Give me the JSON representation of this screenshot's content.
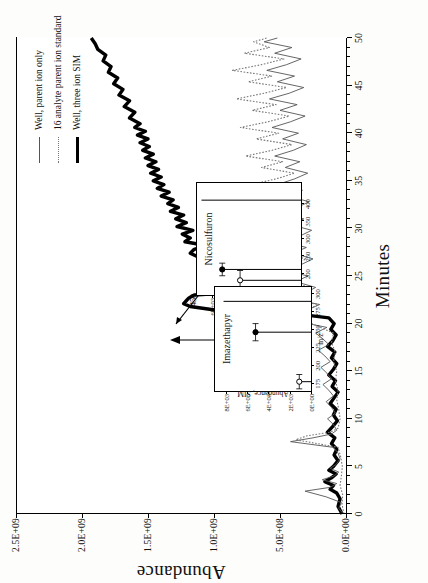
{
  "figure": {
    "kind": "gc-ms-chromatogram",
    "rotation_note": "printed rotated 90 degrees counter-clockwise"
  },
  "legend": {
    "position": "upper-left-of-rotated-page",
    "items": [
      {
        "label": "Well, parent ion only",
        "style": "thin",
        "color": "#555555"
      },
      {
        "label": "16 analyte parent ion standard",
        "style": "dot",
        "color": "#777777"
      },
      {
        "label": "Well, three ion SIM",
        "style": "bold",
        "color": "#000000"
      }
    ]
  },
  "chart_data": {
    "type": "line",
    "title": "",
    "xlabel": "Minutes",
    "ylabel": "Abundance",
    "xlim": [
      0,
      50
    ],
    "ylim": [
      0,
      2500000000
    ],
    "xticks": [
      0,
      5,
      10,
      15,
      20,
      25,
      30,
      35,
      40,
      45,
      50
    ],
    "xticklabels": [
      "0",
      "5",
      "10",
      "15",
      "20",
      "25",
      "30",
      "35",
      "40",
      "45",
      "50"
    ],
    "yticks": [
      0,
      500000000,
      1000000000,
      1500000000,
      2000000000,
      2500000000
    ],
    "yticklabels": [
      "0.0E+00",
      "5.0E+08",
      "1.0E+09",
      "1.5E+09",
      "2.0E+09",
      "2.5E+09"
    ],
    "grid": false,
    "legend_position": "upper right",
    "series": [
      {
        "name": "Well, three ion SIM",
        "style": "bold",
        "color": "#000000",
        "x": [
          0.0,
          0.8,
          1.6,
          2.2,
          2.6,
          3.0,
          3.4,
          3.8,
          4.2,
          4.6,
          5.0,
          5.6,
          6.2,
          6.8,
          7.4,
          8.0,
          8.6,
          9.2,
          9.8,
          10.4,
          11.0,
          11.6,
          12.2,
          12.8,
          13.4,
          14.0,
          14.6,
          15.2,
          15.8,
          16.4,
          17.0,
          17.6,
          18.2,
          18.8,
          19.4,
          20.0,
          20.6,
          21.0,
          21.4,
          21.8,
          22.1,
          22.4,
          22.7,
          23.0,
          23.4,
          23.8,
          24.2,
          24.6,
          25.0,
          25.4,
          25.8,
          26.2,
          26.6,
          27.0,
          27.4,
          27.8,
          28.2,
          28.6,
          29.0,
          29.4,
          29.8,
          30.2,
          30.6,
          31.0,
          31.4,
          31.8,
          32.2,
          32.6,
          33.0,
          33.4,
          33.8,
          34.2,
          34.6,
          35.0,
          35.4,
          35.8,
          36.2,
          36.6,
          37.0,
          37.4,
          37.8,
          38.2,
          38.6,
          39.0,
          39.4,
          39.8,
          40.2,
          40.6,
          41.0,
          41.6,
          42.2,
          42.8,
          43.4,
          44.0,
          44.6,
          45.2,
          45.8,
          46.4,
          47.0,
          47.6,
          48.2,
          48.8,
          49.4,
          50.0
        ],
        "y": [
          30000000,
          60000000,
          45000000,
          70000000,
          120000000,
          95000000,
          160000000,
          110000000,
          75000000,
          130000000,
          95000000,
          60000000,
          90000000,
          70000000,
          110000000,
          85000000,
          140000000,
          100000000,
          65000000,
          95000000,
          75000000,
          120000000,
          90000000,
          60000000,
          105000000,
          80000000,
          130000000,
          95000000,
          70000000,
          110000000,
          85000000,
          140000000,
          100000000,
          75000000,
          115000000,
          90000000,
          130000000,
          360000000,
          980000000,
          1180000000,
          1230000000,
          1210000000,
          1190000000,
          1150000000,
          700000000,
          480000000,
          430000000,
          470000000,
          540000000,
          520000000,
          560000000,
          620000000,
          900000000,
          1120000000,
          1180000000,
          1150000000,
          1060000000,
          1220000000,
          1180000000,
          1240000000,
          1160000000,
          1280000000,
          1210000000,
          1290000000,
          1230000000,
          1330000000,
          1270000000,
          1350000000,
          1310000000,
          1400000000,
          1340000000,
          1430000000,
          1380000000,
          1460000000,
          1400000000,
          1480000000,
          1420000000,
          1500000000,
          1440000000,
          1520000000,
          1460000000,
          1540000000,
          1490000000,
          1560000000,
          1500000000,
          1580000000,
          1520000000,
          1600000000,
          1560000000,
          1640000000,
          1600000000,
          1680000000,
          1640000000,
          1720000000,
          1690000000,
          1760000000,
          1730000000,
          1800000000,
          1780000000,
          1840000000,
          1820000000,
          1880000000,
          1900000000,
          1930000000
        ]
      },
      {
        "name": "Well, parent ion only",
        "style": "thin",
        "color": "#555555",
        "x": [
          0.0,
          0.6,
          1.2,
          1.8,
          2.4,
          2.8,
          3.2,
          3.6,
          4.0,
          4.4,
          4.8,
          5.2,
          5.8,
          6.4,
          7.0,
          7.6,
          8.0,
          8.4,
          8.8,
          9.4,
          10.0,
          10.6,
          11.2,
          11.8,
          12.4,
          13.0,
          13.6,
          14.2,
          14.8,
          15.4,
          16.0,
          16.6,
          17.2,
          17.8,
          18.4,
          19.0,
          19.6,
          20.2,
          20.8,
          21.4,
          22.0,
          22.6,
          23.2,
          23.8,
          24.4,
          25.0,
          25.6,
          26.2,
          26.8,
          27.4,
          28.0,
          28.6,
          29.2,
          29.8,
          30.4,
          31.0,
          31.6,
          32.2,
          32.8,
          33.4,
          34.0,
          34.6,
          35.2,
          35.8,
          36.4,
          37.0,
          37.6,
          38.2,
          38.8,
          39.4,
          40.0,
          40.6,
          41.2,
          41.8,
          42.4,
          43.0,
          43.6,
          44.2,
          44.8,
          45.4,
          46.0,
          46.6,
          47.2,
          47.8,
          48.4,
          49.0,
          49.6,
          50.0
        ],
        "y": [
          20000000,
          55000000,
          35000000,
          150000000,
          310000000,
          120000000,
          70000000,
          180000000,
          90000000,
          55000000,
          120000000,
          75000000,
          45000000,
          60000000,
          95000000,
          420000000,
          250000000,
          110000000,
          70000000,
          95000000,
          140000000,
          80000000,
          110000000,
          150000000,
          95000000,
          130000000,
          175000000,
          110000000,
          145000000,
          190000000,
          120000000,
          160000000,
          210000000,
          130000000,
          175000000,
          230000000,
          145000000,
          360000000,
          480000000,
          300000000,
          200000000,
          420000000,
          310000000,
          230000000,
          380000000,
          290000000,
          460000000,
          340000000,
          250000000,
          400000000,
          300000000,
          480000000,
          350000000,
          260000000,
          420000000,
          320000000,
          500000000,
          370000000,
          280000000,
          440000000,
          330000000,
          520000000,
          390000000,
          290000000,
          460000000,
          350000000,
          540000000,
          400000000,
          300000000,
          480000000,
          360000000,
          560000000,
          420000000,
          310000000,
          500000000,
          370000000,
          580000000,
          430000000,
          320000000,
          520000000,
          390000000,
          600000000,
          450000000,
          340000000,
          540000000,
          410000000,
          620000000,
          520000000
        ]
      },
      {
        "name": "16 analyte parent ion standard",
        "style": "dot",
        "color": "#777777",
        "x": [
          0.0,
          1.0,
          2.0,
          3.0,
          4.0,
          5.0,
          6.0,
          7.0,
          7.8,
          8.2,
          8.6,
          9.0,
          10.0,
          11.0,
          12.0,
          13.0,
          14.0,
          15.0,
          16.0,
          17.0,
          18.0,
          19.0,
          20.0,
          20.6,
          21.0,
          21.5,
          22.0,
          22.6,
          23.2,
          23.8,
          24.4,
          25.0,
          25.6,
          26.2,
          26.8,
          27.4,
          28.0,
          28.6,
          29.2,
          29.8,
          30.4,
          31.0,
          31.6,
          32.2,
          32.8,
          33.4,
          34.0,
          34.6,
          35.2,
          35.8,
          36.4,
          37.0,
          37.6,
          38.2,
          38.8,
          39.4,
          40.0,
          40.6,
          41.2,
          41.8,
          42.4,
          43.0,
          43.6,
          44.2,
          44.8,
          45.4,
          46.0,
          46.6,
          47.2,
          47.8,
          48.4,
          49.0,
          49.6,
          50.0
        ],
        "y": [
          15000000,
          30000000,
          25000000,
          45000000,
          35000000,
          28000000,
          40000000,
          60000000,
          380000000,
          300000000,
          120000000,
          60000000,
          45000000,
          55000000,
          70000000,
          60000000,
          80000000,
          70000000,
          95000000,
          80000000,
          110000000,
          95000000,
          260000000,
          520000000,
          420000000,
          300000000,
          200000000,
          480000000,
          360000000,
          270000000,
          440000000,
          340000000,
          540000000,
          410000000,
          300000000,
          500000000,
          380000000,
          620000000,
          460000000,
          340000000,
          560000000,
          420000000,
          680000000,
          500000000,
          370000000,
          600000000,
          450000000,
          720000000,
          530000000,
          390000000,
          640000000,
          480000000,
          760000000,
          560000000,
          410000000,
          680000000,
          510000000,
          800000000,
          590000000,
          430000000,
          710000000,
          530000000,
          830000000,
          620000000,
          450000000,
          740000000,
          560000000,
          860000000,
          640000000,
          470000000,
          770000000,
          580000000,
          700000000,
          600000000
        ]
      }
    ]
  },
  "insets": [
    {
      "id": "nicosulfuron",
      "title": "Nicosulfuron",
      "xlabel": "",
      "ylabel": "Abundance, SIM",
      "xticks": [
        150,
        200,
        250,
        300,
        350,
        400
      ],
      "xticklabels": [
        "150",
        "200",
        "250",
        "300",
        "350",
        "400"
      ],
      "yticks": [
        0,
        2000,
        4000,
        6000
      ],
      "yticklabels": [
        "0E+00",
        "2E+03",
        "4E+03",
        "6E+03"
      ],
      "xlim": [
        140,
        460
      ],
      "ylim": [
        0,
        7000
      ],
      "points": [
        {
          "mz": 182,
          "value": 4100,
          "marker": "open",
          "err": 28
        },
        {
          "mz": 213,
          "value": 5300,
          "marker": "filled",
          "err": 18
        }
      ],
      "baseline_peaks": [
        {
          "mz": 182,
          "value": 4100
        },
        {
          "mz": 213,
          "value": 5300
        },
        {
          "mz": 411,
          "value": 6700
        }
      ],
      "annotation_tick": "450"
    },
    {
      "id": "imazethapyr",
      "title": "Imazethapyr",
      "xlabel": "m/z",
      "ylabel": "Abundance, SIM",
      "xticks": [
        175,
        200,
        225,
        250,
        275,
        300
      ],
      "xticklabels": [
        "175",
        "200",
        "225",
        "250",
        "275",
        "300"
      ],
      "yticks": [
        0,
        2000,
        4000,
        6000,
        8000
      ],
      "yticklabels": [
        "0E+00",
        "2E+03",
        "4E+03",
        "6E+03",
        "8E+03"
      ],
      "xlim": [
        165,
        310
      ],
      "ylim": [
        0,
        9000
      ],
      "points": [
        {
          "mz": 178,
          "value": 1100,
          "marker": "open",
          "err": 10
        },
        {
          "mz": 247,
          "value": 5200,
          "marker": "filled",
          "err": 12
        }
      ],
      "baseline_peaks": [
        {
          "mz": 178,
          "value": 1100
        },
        {
          "mz": 247,
          "value": 5200
        },
        {
          "mz": 290,
          "value": 8200
        }
      ]
    }
  ]
}
